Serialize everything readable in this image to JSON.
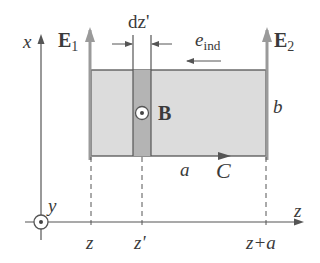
{
  "diagram": {
    "type": "physics-schematic",
    "colors": {
      "loop_fill": "#dcdcdc",
      "strip_fill": "#b4b4b4",
      "line": "#555555",
      "field_arrow": "#9a9a9a",
      "text": "#3a3a3a"
    },
    "labels": {
      "x_axis": "x",
      "y_axis": "y",
      "z_axis": "z",
      "E1": "E",
      "E1_sub": "1",
      "E2": "E",
      "E2_sub": "2",
      "dz": "dz'",
      "e_ind": "e",
      "e_ind_sub": "ind",
      "B": "B",
      "b": "b",
      "a": "a",
      "C": "C",
      "tick_z": "z",
      "tick_zprime": "z'",
      "tick_z_plus_a": "z+a"
    }
  }
}
